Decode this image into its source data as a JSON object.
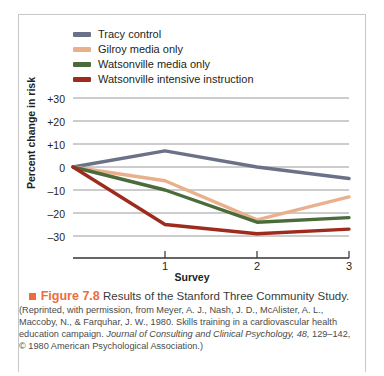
{
  "figure": {
    "number_label": "Figure 7.8",
    "bullet_color": "#ee6c3a",
    "title": "Results of the Stanford Three Community Study.",
    "credit_part1": "(Reprinted, with permission, from Meyer, A. J., Nash, J. D., McAlister,",
    "credit_part2": "A. L., Maccoby, N., & Farquhar, J. W., 1980. Skills training in a cardiovascular",
    "credit_part3": "health education campaign.",
    "credit_journal": "Journal of Consulting and Clinical Psychology, 48,",
    "credit_part4": "129–142, © 1980 American Psychological Association.)"
  },
  "chart_data": {
    "type": "line",
    "title": "Results of the Stanford Three Community Study",
    "xlabel": "Survey",
    "ylabel": "Percent change in risk",
    "x": [
      0,
      1,
      2,
      3
    ],
    "categories": [
      "",
      "1",
      "2",
      "3"
    ],
    "xtick_labels": [
      "1",
      "2",
      "3"
    ],
    "ytick_labels": [
      "+30",
      "+20",
      "+10",
      "0",
      "–10",
      "–20",
      "–30"
    ],
    "ytick_values": [
      30,
      20,
      10,
      0,
      -10,
      -20,
      -30
    ],
    "ylim": [
      -30,
      30
    ],
    "xlim": [
      0,
      3
    ],
    "grid": true,
    "legend_position": "top-left",
    "series": [
      {
        "name": "Tracy control",
        "color": "#6b7288",
        "values": [
          0,
          7,
          0,
          -5
        ]
      },
      {
        "name": "Gilroy media only",
        "color": "#e8b18c",
        "values": [
          0,
          -6,
          -23,
          -13
        ]
      },
      {
        "name": "Watsonville media only",
        "color": "#4c6b3c",
        "values": [
          0,
          -10,
          -24,
          -22
        ]
      },
      {
        "name": "Watsonville intensive instruction",
        "color": "#9e2b1e",
        "values": [
          0,
          -25,
          -29,
          -27
        ]
      }
    ]
  }
}
